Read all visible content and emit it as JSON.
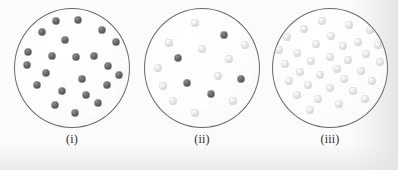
{
  "figure": {
    "kind": "particle-container-diagram",
    "background_color": "#fafafa",
    "vessel_outline_color": "#6b6b6b",
    "vessel_fill_color": "#fdfdfd",
    "dark_particle_color": "#5a5a5a",
    "light_particle_color": "#dcdcdc"
  },
  "panels": [
    {
      "label": "(i)",
      "dark_count": 22,
      "light_count": 0,
      "total_count": 22,
      "particles": [
        {
          "x": 41,
          "y": 12,
          "shade": "dark"
        },
        {
          "x": 63,
          "y": 11,
          "shade": "dark"
        },
        {
          "x": 27,
          "y": 23,
          "shade": "dark"
        },
        {
          "x": 87,
          "y": 21,
          "shade": "dark"
        },
        {
          "x": 50,
          "y": 31,
          "shade": "dark"
        },
        {
          "x": 101,
          "y": 33,
          "shade": "dark"
        },
        {
          "x": 13,
          "y": 43,
          "shade": "dark"
        },
        {
          "x": 37,
          "y": 47,
          "shade": "dark"
        },
        {
          "x": 61,
          "y": 48,
          "shade": "dark"
        },
        {
          "x": 79,
          "y": 47,
          "shade": "dark"
        },
        {
          "x": 12,
          "y": 56,
          "shade": "dark"
        },
        {
          "x": 93,
          "y": 57,
          "shade": "dark"
        },
        {
          "x": 31,
          "y": 64,
          "shade": "dark"
        },
        {
          "x": 67,
          "y": 70,
          "shade": "dark"
        },
        {
          "x": 22,
          "y": 76,
          "shade": "dark"
        },
        {
          "x": 92,
          "y": 76,
          "shade": "dark"
        },
        {
          "x": 47,
          "y": 82,
          "shade": "dark"
        },
        {
          "x": 40,
          "y": 96,
          "shade": "dark"
        },
        {
          "x": 83,
          "y": 94,
          "shade": "dark"
        },
        {
          "x": 60,
          "y": 104,
          "shade": "dark"
        },
        {
          "x": 71,
          "y": 86,
          "shade": "dark"
        },
        {
          "x": 104,
          "y": 66,
          "shade": "dark"
        }
      ]
    },
    {
      "label": "(ii)",
      "dark_count": 5,
      "light_count": 11,
      "total_count": 16,
      "particles": [
        {
          "x": 50,
          "y": 14,
          "shade": "light"
        },
        {
          "x": 79,
          "y": 26,
          "shade": "dark"
        },
        {
          "x": 24,
          "y": 34,
          "shade": "light"
        },
        {
          "x": 100,
          "y": 36,
          "shade": "light"
        },
        {
          "x": 57,
          "y": 40,
          "shade": "light"
        },
        {
          "x": 33,
          "y": 49,
          "shade": "dark"
        },
        {
          "x": 84,
          "y": 50,
          "shade": "light"
        },
        {
          "x": 13,
          "y": 59,
          "shade": "light"
        },
        {
          "x": 73,
          "y": 67,
          "shade": "light"
        },
        {
          "x": 96,
          "y": 70,
          "shade": "dark"
        },
        {
          "x": 42,
          "y": 74,
          "shade": "dark"
        },
        {
          "x": 18,
          "y": 77,
          "shade": "light"
        },
        {
          "x": 66,
          "y": 85,
          "shade": "dark"
        },
        {
          "x": 28,
          "y": 92,
          "shade": "light"
        },
        {
          "x": 88,
          "y": 92,
          "shade": "light"
        },
        {
          "x": 50,
          "y": 104,
          "shade": "light"
        }
      ]
    },
    {
      "label": "(iii)",
      "dark_count": 0,
      "light_count": 33,
      "total_count": 33,
      "particles": [
        {
          "x": 49,
          "y": 12,
          "shade": "light"
        },
        {
          "x": 76,
          "y": 16,
          "shade": "light"
        },
        {
          "x": 31,
          "y": 20,
          "shade": "light"
        },
        {
          "x": 97,
          "y": 21,
          "shade": "light"
        },
        {
          "x": 58,
          "y": 27,
          "shade": "light"
        },
        {
          "x": 14,
          "y": 28,
          "shade": "light"
        },
        {
          "x": 43,
          "y": 35,
          "shade": "light"
        },
        {
          "x": 85,
          "y": 33,
          "shade": "light"
        },
        {
          "x": 70,
          "y": 37,
          "shade": "light"
        },
        {
          "x": 105,
          "y": 36,
          "shade": "light"
        },
        {
          "x": 6,
          "y": 41,
          "shade": "light"
        },
        {
          "x": 24,
          "y": 44,
          "shade": "light"
        },
        {
          "x": 93,
          "y": 45,
          "shade": "light"
        },
        {
          "x": 57,
          "y": 48,
          "shade": "light"
        },
        {
          "x": 38,
          "y": 52,
          "shade": "light"
        },
        {
          "x": 75,
          "y": 51,
          "shade": "light"
        },
        {
          "x": 12,
          "y": 55,
          "shade": "light"
        },
        {
          "x": 107,
          "y": 53,
          "shade": "light"
        },
        {
          "x": 64,
          "y": 60,
          "shade": "light"
        },
        {
          "x": 27,
          "y": 63,
          "shade": "light"
        },
        {
          "x": 88,
          "y": 62,
          "shade": "light"
        },
        {
          "x": 47,
          "y": 66,
          "shade": "light"
        },
        {
          "x": 71,
          "y": 70,
          "shade": "light"
        },
        {
          "x": 16,
          "y": 72,
          "shade": "light"
        },
        {
          "x": 99,
          "y": 72,
          "shade": "light"
        },
        {
          "x": 35,
          "y": 76,
          "shade": "light"
        },
        {
          "x": 57,
          "y": 79,
          "shade": "light"
        },
        {
          "x": 80,
          "y": 82,
          "shade": "light"
        },
        {
          "x": 24,
          "y": 86,
          "shade": "light"
        },
        {
          "x": 45,
          "y": 90,
          "shade": "light"
        },
        {
          "x": 92,
          "y": 90,
          "shade": "light"
        },
        {
          "x": 66,
          "y": 95,
          "shade": "light"
        },
        {
          "x": 37,
          "y": 101,
          "shade": "light"
        }
      ]
    }
  ]
}
